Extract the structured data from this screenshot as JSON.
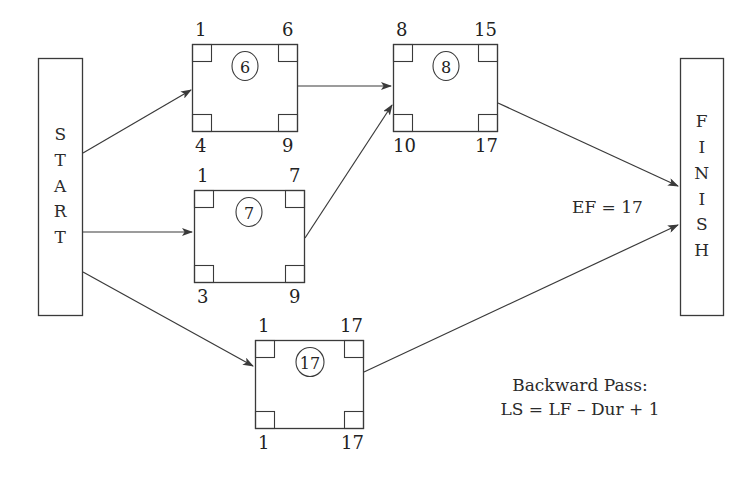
{
  "diagram": {
    "start_node": {
      "label_chars": [
        "S",
        "T",
        "A",
        "R",
        "T"
      ],
      "text": "START"
    },
    "finish_node": {
      "label_chars": [
        "F",
        "I",
        "N",
        "I",
        "S",
        "H"
      ],
      "text": "FINISH"
    },
    "nodes": [
      {
        "id": "node-a",
        "duration": "6",
        "early_start": "1",
        "early_finish": "6",
        "late_start": "4",
        "late_finish": "9"
      },
      {
        "id": "node-b",
        "duration": "8",
        "early_start": "8",
        "early_finish": "15",
        "late_start": "10",
        "late_finish": "17"
      },
      {
        "id": "node-c",
        "duration": "7",
        "early_start": "1",
        "early_finish": "7",
        "late_start": "3",
        "late_finish": "9"
      },
      {
        "id": "node-d",
        "duration": "17",
        "early_start": "1",
        "early_finish": "17",
        "late_start": "1",
        "late_finish": "17"
      }
    ],
    "annotations": {
      "ef_label": "EF = 17",
      "backward_pass_title": "Backward Pass:",
      "backward_pass_formula": "LS = LF – Dur + 1"
    },
    "colors": {
      "stroke": "#3a3a3a",
      "text": "#2b2b2b",
      "background": "#ffffff"
    }
  }
}
